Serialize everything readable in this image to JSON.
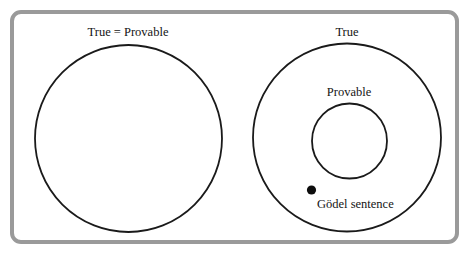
{
  "figure": {
    "width": 470,
    "height": 259,
    "background_color": "#ffffff"
  },
  "frame": {
    "name": "outer-frame",
    "stroke_color": "#9a9a9a",
    "stroke_width": 4,
    "corner_radius": 9,
    "x": 12,
    "y": 12,
    "width": 445,
    "height": 230
  },
  "panels": [
    {
      "id": "left-panel",
      "title": "True = Provable",
      "title_x": 128,
      "title_y": 36,
      "circles": [
        {
          "id": "true-provable-circle",
          "name": "true-equals-provable-circle",
          "cx": 128.5,
          "cy": 138.5,
          "r": 93.5,
          "stroke_color": "#1a1a1a",
          "stroke_width": 1.8,
          "fill": "#ffffff"
        }
      ]
    },
    {
      "id": "right-panel",
      "title": "True",
      "title_x": 347,
      "title_y": 36,
      "circles": [
        {
          "id": "true-circle",
          "name": "true-circle",
          "cx": 347,
          "cy": 137.5,
          "r": 94,
          "stroke_color": "#1a1a1a",
          "stroke_width": 1.8,
          "fill": "#ffffff"
        },
        {
          "id": "provable-circle",
          "name": "provable-circle",
          "cx": 349.5,
          "cy": 141,
          "r": 37.5,
          "stroke_color": "#1a1a1a",
          "stroke_width": 1.8,
          "fill": "#ffffff"
        }
      ],
      "inner_label": {
        "text": "Provable",
        "x": 349,
        "y": 96
      },
      "point": {
        "id": "godel-point",
        "name": "godel-sentence-point",
        "cx": 311.5,
        "cy": 190,
        "r": 4.6,
        "color": "#0d0d0d",
        "label": "Gödel sentence",
        "label_x": 317,
        "label_y": 208
      }
    }
  ],
  "labels": {
    "left_title": "True = Provable",
    "right_title": "True",
    "provable": "Provable",
    "godel_sentence": "Gödel sentence"
  },
  "colors": {
    "frame": "#9a9a9a",
    "circle_stroke": "#1a1a1a",
    "text": "#141414",
    "point": "#0d0d0d",
    "background": "#ffffff"
  }
}
